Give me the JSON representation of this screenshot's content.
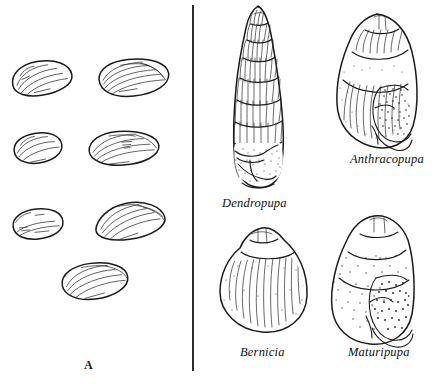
{
  "figure": {
    "kind": "scientific-illustration",
    "background_color": "#ffffff",
    "ink_color": "#1a1a1a",
    "divider": {
      "orientation": "vertical",
      "color": "#2b2b2b"
    }
  },
  "panels": [
    {
      "letter": "A",
      "subject": "bivalve shells",
      "specimen_count": 7,
      "specimens": [
        {
          "index": 1,
          "name": "bivalve-shell-upper-left",
          "cx": 42,
          "cy": 78,
          "rx": 30,
          "ry": 16,
          "rot": -10,
          "size": "small"
        },
        {
          "index": 2,
          "name": "bivalve-shell-upper-right",
          "cx": 134,
          "cy": 78,
          "rx": 35,
          "ry": 18,
          "rot": -6,
          "size": "large"
        },
        {
          "index": 3,
          "name": "bivalve-shell-middle-left",
          "cx": 38,
          "cy": 148,
          "rx": 24,
          "ry": 14,
          "rot": -8,
          "size": "small"
        },
        {
          "index": 4,
          "name": "bivalve-shell-middle-right",
          "cx": 124,
          "cy": 148,
          "rx": 35,
          "ry": 17,
          "rot": -4,
          "size": "large"
        },
        {
          "index": 5,
          "name": "bivalve-shell-lower-left",
          "cx": 38,
          "cy": 224,
          "rx": 25,
          "ry": 14,
          "rot": -6,
          "size": "small"
        },
        {
          "index": 6,
          "name": "bivalve-shell-lower-right",
          "cx": 130,
          "cy": 221,
          "rx": 35,
          "ry": 17,
          "rot": -8,
          "size": "large"
        },
        {
          "index": 7,
          "name": "bivalve-shell-bottom-center",
          "cx": 95,
          "cy": 281,
          "rx": 33,
          "ry": 17,
          "rot": -7,
          "size": "large"
        }
      ]
    },
    {
      "letter": "B",
      "subject": "fossil land snail shells",
      "specimen_count": 4,
      "specimens": [
        {
          "index": 1,
          "name": "dendropupa-shell",
          "label": "Dendropupa",
          "shape": "elongate high-spired",
          "whorls": 8,
          "aperture": "basal, stippled",
          "cx": 268,
          "cy": 100
        },
        {
          "index": 2,
          "name": "anthracopupa-shell",
          "label": "Anthracopupa",
          "shape": "ovate-conic",
          "whorls": 5,
          "aperture": "right lateral, densely stippled",
          "cx": 388,
          "cy": 82
        },
        {
          "index": 3,
          "name": "bernicia-shell",
          "label": "Bernicia",
          "shape": "globose ribbed",
          "whorls": 4,
          "aperture": "not visible",
          "cx": 268,
          "cy": 285
        },
        {
          "index": 4,
          "name": "maturipupa-shell",
          "label": "Maturipupa",
          "shape": "ovate-conic stippled",
          "whorls": 5,
          "aperture": "right lateral, densely stippled",
          "cx": 388,
          "cy": 280
        }
      ]
    }
  ],
  "labels": {
    "panel_a_letter": "A",
    "panel_b_letter": "B",
    "dendropupa": "Dendropupa",
    "anthracopupa": "Anthracopupa",
    "bernicia": "Bernicia",
    "maturipupa": "Maturipupa"
  }
}
